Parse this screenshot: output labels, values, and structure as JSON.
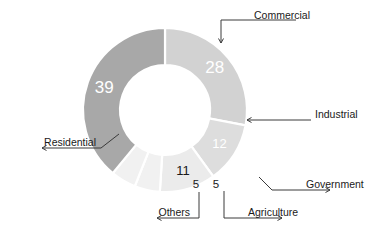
{
  "chart_data": {
    "type": "pie",
    "variant": "donut",
    "title": "",
    "subtitle": "",
    "xlabel": "",
    "ylabel": "",
    "legend": "none",
    "grid": false,
    "total": 100,
    "start_angle_deg": 0,
    "direction": "clockwise",
    "categories": [
      "Commercial",
      "Industrial",
      "Government",
      "Agriculture",
      "Others",
      "Residential"
    ],
    "values": [
      28,
      12,
      11,
      5,
      5,
      39
    ],
    "labels": [
      "28",
      "12",
      "11",
      "5",
      "5",
      "39"
    ],
    "colors": [
      "#d2d2d2",
      "#dddddd",
      "#ebebeb",
      "#f1f1f1",
      "#f1f1f1",
      "#a8a8a8"
    ],
    "value_text_colors": [
      "#ffffff",
      "#ffffff",
      "#1a1a1a",
      "#1a1a1a",
      "#1a1a1a",
      "#ffffff"
    ],
    "slices": [
      {
        "name": "Commercial",
        "value": 28,
        "label": "28",
        "color": "#d2d2d2",
        "value_color": "#ffffff"
      },
      {
        "name": "Industrial",
        "value": 12,
        "label": "12",
        "color": "#dddddd",
        "value_color": "#ffffff"
      },
      {
        "name": "Government",
        "value": 11,
        "label": "11",
        "color": "#ebebeb",
        "value_color": "#1a1a1a"
      },
      {
        "name": "Agriculture",
        "value": 5,
        "label": "5",
        "color": "#f1f1f1",
        "value_color": "#1a1a1a"
      },
      {
        "name": "Others",
        "value": 5,
        "label": "5",
        "color": "#f1f1f1",
        "value_color": "#1a1a1a"
      },
      {
        "name": "Residential",
        "value": 39,
        "label": "39",
        "color": "#a8a8a8",
        "value_color": "#ffffff"
      }
    ]
  },
  "chart": {
    "background": "#ffffff",
    "line_color": "#3a3a3a",
    "text_color": "#1a1a1a"
  },
  "callouts": {
    "commercial": {
      "label": "Commercial"
    },
    "industrial": {
      "label": "Industrial"
    },
    "government": {
      "label": "Government"
    },
    "agriculture": {
      "label": "Agriculture"
    },
    "others": {
      "label": "Others"
    },
    "residential": {
      "label": "Residential"
    }
  },
  "values": {
    "commercial": "28",
    "industrial": "12",
    "government": "11",
    "agriculture": "5",
    "others": "5",
    "residential": "39"
  }
}
